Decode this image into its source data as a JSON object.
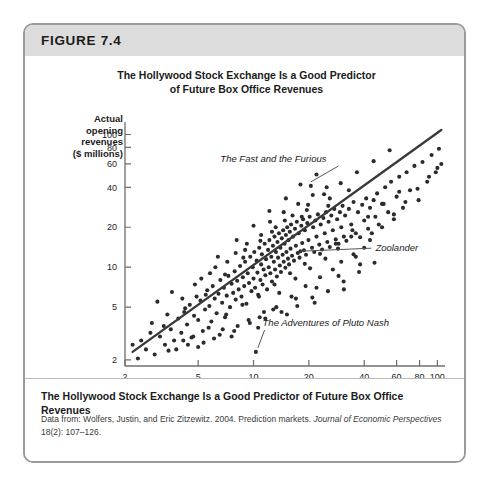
{
  "figure": {
    "number_label": "FIGURE 7.4",
    "chart_title_line1": "The Hollywood Stock Exchange Is a Good Predictor",
    "chart_title_line2": "of Future Box Office Revenues",
    "caption": "The Hollywood Stock Exchange Is a Good Predictor of Future Box Office Revenues",
    "source_prefix": "Data from: ",
    "source_authors": "Wolfers, Justin, and Eric Zitzewitz. 2004. Prediction markets. ",
    "source_journal": "Journal of Economic Perspectives",
    "source_locator": " 18(2): 107–126."
  },
  "colors": {
    "header_band": "#dcdcdc",
    "card_border": "#9a9a9a",
    "point": "#2b2b2b",
    "trend_line": "#3a3a3a",
    "axis": "#6e6e6e",
    "text": "#1b1b1b"
  },
  "chart_data": {
    "type": "scatter",
    "title": "The Hollywood Stock Exchange Is a Good Predictor of Future Box Office Revenues",
    "xlabel": "Predicted Opening Revenues = HSX Market Price ($ million)",
    "ylabel": "Actual opening revenues ($ millions)",
    "ylabel_lines": [
      "Actual",
      "opening",
      "revenues",
      "($ millions)"
    ],
    "xscale": "log",
    "yscale": "log",
    "xlim": [
      2,
      110
    ],
    "ylim": [
      1.8,
      120
    ],
    "grid": false,
    "legend": "none",
    "xticks": [
      2,
      5,
      10,
      20,
      40,
      60,
      80,
      100
    ],
    "xtick_labels": [
      "2",
      "5",
      "10",
      "20",
      "40",
      "60",
      "80",
      "100"
    ],
    "yticks": [
      2,
      5,
      10,
      20,
      40,
      60,
      80,
      100
    ],
    "ytick_labels": [
      "2",
      "5",
      "10",
      "20",
      "40",
      "60",
      "80",
      "100"
    ],
    "trend_line": {
      "x": [
        2.2,
        105
      ],
      "y": [
        2.3,
        108
      ],
      "note": "45-degree-like regression of actual on predicted"
    },
    "annotations": [
      {
        "label": "The Fast and the Furious",
        "point_x": 20.5,
        "point_y": 41.0,
        "text_x": 6.6,
        "text_y": 62.0
      },
      {
        "label": "Zoolander",
        "point_x": 18.0,
        "point_y": 13.2,
        "text_x": 46.0,
        "text_y": 13.2
      },
      {
        "label": "The Adventures of Pluto Nash",
        "point_x": 10.3,
        "point_y": 2.3,
        "text_x": 11.2,
        "text_y": 3.6
      }
    ],
    "points": [
      [
        2.35,
        2.05
      ],
      [
        2.6,
        2.4
      ],
      [
        2.9,
        2.2
      ],
      [
        3.1,
        3.0
      ],
      [
        3.3,
        2.6
      ],
      [
        3.55,
        3.4
      ],
      [
        3.7,
        2.8
      ],
      [
        3.9,
        4.1
      ],
      [
        4.05,
        3.2
      ],
      [
        4.2,
        4.6
      ],
      [
        4.35,
        3.7
      ],
      [
        4.5,
        5.2
      ],
      [
        4.6,
        2.95
      ],
      [
        4.75,
        4.3
      ],
      [
        4.9,
        6.0
      ],
      [
        5.0,
        4.0
      ],
      [
        5.15,
        5.6
      ],
      [
        5.3,
        3.3
      ],
      [
        5.45,
        4.8
      ],
      [
        5.6,
        6.7
      ],
      [
        5.75,
        5.1
      ],
      [
        5.9,
        3.9
      ],
      [
        6.0,
        7.2
      ],
      [
        6.15,
        5.8
      ],
      [
        6.3,
        4.5
      ],
      [
        6.45,
        6.3
      ],
      [
        6.6,
        8.0
      ],
      [
        6.75,
        5.4
      ],
      [
        6.9,
        7.0
      ],
      [
        7.0,
        4.2
      ],
      [
        7.15,
        6.1
      ],
      [
        7.3,
        8.6
      ],
      [
        7.45,
        5.0
      ],
      [
        7.6,
        7.5
      ],
      [
        7.75,
        6.4
      ],
      [
        7.9,
        9.3
      ],
      [
        8.0,
        5.7
      ],
      [
        8.15,
        7.9
      ],
      [
        8.3,
        6.8
      ],
      [
        8.45,
        10.2
      ],
      [
        8.6,
        6.0
      ],
      [
        8.75,
        8.4
      ],
      [
        8.9,
        7.2
      ],
      [
        9.0,
        11.0
      ],
      [
        9.15,
        5.3
      ],
      [
        9.3,
        9.0
      ],
      [
        9.45,
        7.6
      ],
      [
        9.6,
        12.0
      ],
      [
        9.75,
        6.6
      ],
      [
        9.9,
        10.0
      ],
      [
        10.0,
        8.2
      ],
      [
        10.1,
        13.0
      ],
      [
        10.2,
        7.0
      ],
      [
        10.3,
        2.3
      ],
      [
        10.4,
        11.2
      ],
      [
        10.5,
        9.1
      ],
      [
        10.6,
        6.2
      ],
      [
        10.75,
        14.0
      ],
      [
        10.9,
        8.0
      ],
      [
        11.0,
        10.5
      ],
      [
        11.1,
        12.5
      ],
      [
        11.2,
        7.4
      ],
      [
        11.35,
        9.6
      ],
      [
        11.5,
        15.0
      ],
      [
        11.6,
        8.7
      ],
      [
        11.7,
        11.5
      ],
      [
        11.85,
        6.8
      ],
      [
        12.0,
        13.5
      ],
      [
        12.1,
        10.0
      ],
      [
        12.2,
        16.0
      ],
      [
        12.35,
        9.0
      ],
      [
        12.5,
        12.0
      ],
      [
        12.6,
        7.8
      ],
      [
        12.75,
        14.5
      ],
      [
        12.9,
        11.0
      ],
      [
        13.0,
        17.0
      ],
      [
        13.1,
        9.6
      ],
      [
        13.25,
        13.0
      ],
      [
        13.4,
        8.5
      ],
      [
        13.5,
        15.5
      ],
      [
        13.6,
        11.8
      ],
      [
        13.75,
        18.0
      ],
      [
        13.9,
        10.3
      ],
      [
        14.0,
        14.0
      ],
      [
        14.1,
        9.2
      ],
      [
        14.25,
        16.5
      ],
      [
        14.4,
        12.4
      ],
      [
        14.5,
        19.0
      ],
      [
        14.6,
        11.0
      ],
      [
        14.75,
        15.0
      ],
      [
        14.9,
        9.9
      ],
      [
        15.0,
        17.5
      ],
      [
        15.1,
        13.0
      ],
      [
        15.25,
        20.0
      ],
      [
        15.4,
        11.6
      ],
      [
        15.5,
        16.0
      ],
      [
        15.6,
        10.5
      ],
      [
        15.75,
        18.5
      ],
      [
        15.9,
        13.8
      ],
      [
        16.0,
        21.0
      ],
      [
        16.2,
        12.2
      ],
      [
        16.4,
        17.0
      ],
      [
        16.6,
        11.2
      ],
      [
        16.8,
        19.5
      ],
      [
        17.0,
        14.5
      ],
      [
        17.2,
        22.0
      ],
      [
        17.4,
        12.8
      ],
      [
        17.6,
        18.0
      ],
      [
        17.8,
        11.8
      ],
      [
        18.0,
        13.2
      ],
      [
        18.2,
        20.5
      ],
      [
        18.4,
        15.2
      ],
      [
        18.6,
        23.0
      ],
      [
        18.8,
        13.4
      ],
      [
        19.0,
        19.0
      ],
      [
        19.3,
        12.4
      ],
      [
        19.6,
        21.5
      ],
      [
        19.9,
        16.0
      ],
      [
        20.2,
        24.0
      ],
      [
        20.5,
        41.0
      ],
      [
        20.8,
        14.0
      ],
      [
        21.1,
        20.0
      ],
      [
        21.4,
        13.0
      ],
      [
        21.7,
        22.5
      ],
      [
        22.0,
        17.0
      ],
      [
        22.4,
        25.0
      ],
      [
        22.8,
        14.8
      ],
      [
        23.2,
        21.0
      ],
      [
        23.6,
        13.6
      ],
      [
        24.0,
        23.5
      ],
      [
        24.4,
        18.0
      ],
      [
        24.8,
        26.0
      ],
      [
        25.2,
        15.5
      ],
      [
        25.6,
        22.0
      ],
      [
        26.0,
        14.2
      ],
      [
        26.5,
        24.5
      ],
      [
        27.0,
        19.0
      ],
      [
        27.5,
        27.5
      ],
      [
        28.0,
        16.2
      ],
      [
        28.5,
        23.0
      ],
      [
        29.0,
        15.0
      ],
      [
        29.5,
        26.0
      ],
      [
        30.0,
        20.0
      ],
      [
        30.5,
        29.0
      ],
      [
        31.0,
        17.0
      ],
      [
        31.5,
        24.5
      ],
      [
        32.0,
        15.8
      ],
      [
        33.0,
        27.5
      ],
      [
        34.0,
        21.0
      ],
      [
        35.0,
        31.0
      ],
      [
        36.0,
        18.0
      ],
      [
        37.0,
        26.0
      ],
      [
        38.0,
        16.8
      ],
      [
        39.0,
        29.5
      ],
      [
        40.0,
        22.5
      ],
      [
        41.0,
        33.0
      ],
      [
        42.0,
        19.5
      ],
      [
        43.0,
        28.0
      ],
      [
        44.0,
        18.0
      ],
      [
        45.0,
        32.0
      ],
      [
        46.0,
        24.0
      ],
      [
        47.0,
        36.0
      ],
      [
        48.0,
        21.0
      ],
      [
        50.0,
        30.0
      ],
      [
        52.0,
        40.0
      ],
      [
        54.0,
        26.0
      ],
      [
        56.0,
        44.0
      ],
      [
        58.0,
        23.0
      ],
      [
        60.0,
        34.0
      ],
      [
        62.0,
        48.0
      ],
      [
        65.0,
        28.0
      ],
      [
        68.0,
        52.0
      ],
      [
        71.0,
        38.0
      ],
      [
        75.0,
        58.0
      ],
      [
        79.0,
        32.0
      ],
      [
        83.0,
        62.0
      ],
      [
        88.0,
        44.0
      ],
      [
        93.0,
        70.0
      ],
      [
        98.0,
        52.0
      ],
      [
        102.0,
        78.0
      ],
      [
        105.0,
        60.0
      ],
      [
        3.0,
        5.5
      ],
      [
        3.6,
        6.5
      ],
      [
        4.4,
        2.6
      ],
      [
        5.2,
        8.2
      ],
      [
        6.1,
        2.9
      ],
      [
        7.2,
        11.0
      ],
      [
        8.2,
        3.6
      ],
      [
        9.2,
        15.0
      ],
      [
        10.8,
        4.2
      ],
      [
        12.3,
        22.0
      ],
      [
        13.3,
        5.0
      ],
      [
        14.6,
        26.0
      ],
      [
        16.1,
        6.0
      ],
      [
        17.5,
        30.0
      ],
      [
        19.2,
        7.2
      ],
      [
        21.0,
        35.0
      ],
      [
        23.0,
        8.4
      ],
      [
        25.0,
        40.0
      ],
      [
        27.0,
        9.6
      ],
      [
        30.0,
        11.0
      ],
      [
        35.0,
        12.5
      ],
      [
        40.0,
        14.0
      ],
      [
        4.8,
        7.4
      ],
      [
        5.8,
        9.0
      ],
      [
        6.8,
        3.4
      ],
      [
        8.0,
        12.8
      ],
      [
        9.4,
        4.0
      ],
      [
        11.0,
        17.5
      ],
      [
        12.8,
        4.8
      ],
      [
        14.8,
        22.5
      ],
      [
        17.0,
        5.8
      ],
      [
        19.5,
        27.0
      ],
      [
        22.0,
        7.0
      ],
      [
        26.0,
        33.0
      ],
      [
        29.0,
        8.6
      ],
      [
        33.0,
        38.0
      ],
      [
        38.0,
        10.5
      ],
      [
        2.8,
        3.8
      ],
      [
        3.4,
        4.4
      ],
      [
        4.1,
        5.8
      ],
      [
        5.0,
        2.5
      ],
      [
        6.2,
        10.0
      ],
      [
        7.6,
        3.0
      ],
      [
        9.0,
        13.5
      ],
      [
        10.6,
        3.5
      ],
      [
        12.6,
        18.5
      ],
      [
        15.2,
        4.4
      ],
      [
        18.3,
        24.0
      ],
      [
        21.5,
        5.4
      ],
      [
        25.5,
        29.0
      ],
      [
        31.0,
        6.8
      ],
      [
        36.0,
        12.0
      ],
      [
        43.0,
        16.0
      ],
      [
        50.0,
        20.0
      ],
      [
        58.0,
        25.0
      ],
      [
        67.0,
        31.0
      ],
      [
        78.0,
        39.0
      ],
      [
        90.0,
        48.0
      ],
      [
        100.0,
        56.0
      ],
      [
        2.45,
        2.8
      ],
      [
        3.25,
        3.6
      ],
      [
        4.25,
        4.9
      ],
      [
        5.5,
        6.2
      ],
      [
        7.0,
        8.8
      ],
      [
        8.8,
        11.8
      ],
      [
        10.9,
        15.8
      ],
      [
        13.2,
        20.0
      ],
      [
        16.3,
        24.5
      ],
      [
        19.8,
        29.5
      ],
      [
        24.2,
        35.5
      ],
      [
        29.8,
        43.0
      ],
      [
        36.5,
        52.0
      ],
      [
        45.0,
        63.0
      ],
      [
        55.0,
        76.0
      ],
      [
        11.4,
        4.6
      ],
      [
        13.8,
        6.4
      ],
      [
        16.9,
        8.2
      ],
      [
        20.3,
        9.8
      ],
      [
        24.6,
        11.6
      ],
      [
        28.8,
        13.8
      ],
      [
        34.0,
        17.0
      ],
      [
        6.4,
        12.0
      ],
      [
        8.1,
        16.0
      ],
      [
        10.0,
        20.5
      ],
      [
        12.2,
        26.5
      ],
      [
        15.0,
        33.0
      ],
      [
        18.0,
        42.0
      ],
      [
        22.0,
        50.0
      ],
      [
        3.8,
        2.4
      ],
      [
        4.7,
        3.0
      ],
      [
        5.7,
        3.5
      ],
      [
        7.1,
        4.4
      ],
      [
        8.7,
        5.2
      ],
      [
        10.7,
        6.0
      ],
      [
        13.0,
        7.4
      ],
      [
        15.8,
        9.0
      ],
      [
        19.0,
        10.6
      ],
      [
        23.0,
        12.6
      ],
      [
        28.0,
        15.0
      ],
      [
        34.5,
        19.0
      ],
      [
        42.0,
        24.0
      ],
      [
        51.0,
        30.0
      ],
      [
        62.0,
        37.0
      ],
      [
        2.2,
        2.6
      ],
      [
        2.75,
        3.2
      ],
      [
        3.45,
        2.35
      ],
      [
        4.15,
        2.8
      ],
      [
        5.35,
        2.7
      ],
      [
        6.55,
        3.1
      ],
      [
        7.85,
        3.3
      ],
      [
        9.55,
        3.8
      ],
      [
        11.6,
        4.1
      ],
      [
        14.2,
        4.6
      ],
      [
        17.3,
        5.1
      ],
      [
        20.9,
        5.9
      ],
      [
        25.4,
        6.6
      ],
      [
        30.9,
        7.8
      ],
      [
        37.5,
        9.2
      ],
      [
        45.5,
        10.8
      ]
    ]
  }
}
